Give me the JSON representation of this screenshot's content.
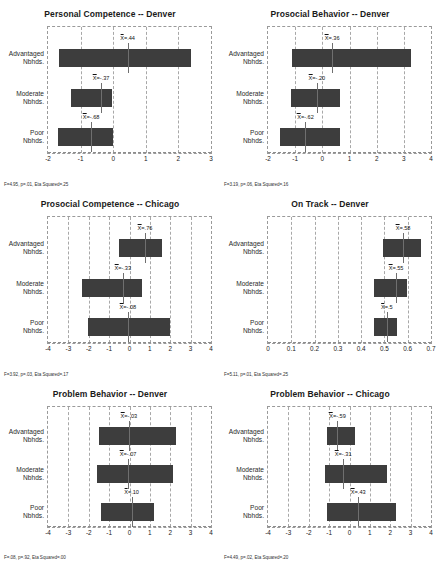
{
  "figure": {
    "background": "#ffffff",
    "bar_color": "#3d3d3d",
    "grid_color": "#9a9a9a"
  },
  "row_labels": [
    {
      "line1": "Advantaged",
      "line2": "Nbhds."
    },
    {
      "line1": "Moderate",
      "line2": "Nbhds."
    },
    {
      "line1": "Poor",
      "line2": "Nbhds."
    }
  ],
  "chart_data": [
    {
      "type": "bar",
      "title": "Personal Competence -- Denver",
      "xlabel": "",
      "ylabel": "",
      "xlim": [
        -2,
        3
      ],
      "ticks": [
        "-2",
        "-1",
        "0",
        "1",
        "2",
        "3"
      ],
      "tick_values": [
        -2,
        -1,
        0,
        1,
        2,
        3
      ],
      "grid": true,
      "categories": [
        "Advantaged Nbhds.",
        "Moderate Nbhds.",
        "Poor Nbhds."
      ],
      "bars": [
        {
          "start": -1.66,
          "end": 2.38,
          "mean": 0.44,
          "mean_label": "X=.44"
        },
        {
          "start": -1.28,
          "end": -0.03,
          "mean": -0.37,
          "mean_label": "X=-.37"
        },
        {
          "start": -1.7,
          "end": -0.02,
          "mean": -0.68,
          "mean_label": "X=-.68"
        }
      ],
      "footnote": "F=4.95, p=.01, Eta Squared=.25"
    },
    {
      "type": "bar",
      "title": "Prosocial Behavior -- Denver",
      "xlabel": "",
      "ylabel": "",
      "xlim": [
        -2,
        4
      ],
      "ticks": [
        "-2",
        "-1",
        "0",
        "1",
        "2",
        "3",
        "4"
      ],
      "tick_values": [
        -2,
        -1,
        0,
        1,
        2,
        3,
        4
      ],
      "grid": true,
      "categories": [
        "Advantaged Nbhds.",
        "Moderate Nbhds.",
        "Poor Nbhds."
      ],
      "bars": [
        {
          "start": -1.12,
          "end": 3.28,
          "mean": 0.36,
          "mean_label": "X=.36"
        },
        {
          "start": -1.16,
          "end": 0.66,
          "mean": -0.2,
          "mean_label": "X=-.20"
        },
        {
          "start": -1.56,
          "end": 0.66,
          "mean": -0.62,
          "mean_label": "X=-.62"
        }
      ],
      "footnote": "F=3.19, p=.06, Eta Squared=.16"
    },
    {
      "type": "bar",
      "title": "Prosocial Competence -- Chicago",
      "xlabel": "",
      "ylabel": "",
      "xlim": [
        -4,
        4
      ],
      "ticks": [
        "-4",
        "-3",
        "-2",
        "-1",
        "0",
        "1",
        "2",
        "3",
        "4"
      ],
      "tick_values": [
        -4,
        -3,
        -2,
        -1,
        0,
        1,
        2,
        3,
        4
      ],
      "grid": true,
      "categories": [
        "Advantaged Nbhds.",
        "Moderate Nbhds.",
        "Poor Nbhds."
      ],
      "bars": [
        {
          "start": -0.52,
          "end": 1.62,
          "mean": 0.76,
          "mean_label": "X=.76"
        },
        {
          "start": -2.32,
          "end": 0.62,
          "mean": -0.33,
          "mean_label": "X=-.33"
        },
        {
          "start": -2.02,
          "end": 1.98,
          "mean": -0.08,
          "mean_label": "X=-.08"
        }
      ],
      "footnote": "F=3.92, p=.03, Eta Squared=.17"
    },
    {
      "type": "bar",
      "title": "On Track -- Denver",
      "xlabel": "",
      "ylabel": "",
      "xlim": [
        0,
        0.7
      ],
      "ticks": [
        "0",
        "0.1",
        "0.2",
        "0.3",
        "0.4",
        "0.5",
        "0.6",
        "0.7"
      ],
      "tick_values": [
        0,
        0.1,
        0.2,
        0.3,
        0.4,
        0.5,
        0.6,
        0.7
      ],
      "grid": true,
      "categories": [
        "Advantaged Nbhds.",
        "Moderate Nbhds.",
        "Poor Nbhds."
      ],
      "bars": [
        {
          "start": 0.492,
          "end": 0.655,
          "mean": 0.58,
          "mean_label": "X=.58"
        },
        {
          "start": 0.455,
          "end": 0.595,
          "mean": 0.55,
          "mean_label": "X=.55"
        },
        {
          "start": 0.455,
          "end": 0.552,
          "mean": 0.51,
          "mean_label": "X=.5"
        }
      ],
      "footnote": "F=5.11, p=.01, Eta Squared=.25"
    },
    {
      "type": "bar",
      "title": "Problem Behavior  --  Denver",
      "xlabel": "",
      "ylabel": "",
      "xlim": [
        -4,
        4
      ],
      "ticks": [
        "-4",
        "-3",
        "-2",
        "-1",
        "0",
        "1",
        "2",
        "3",
        "4"
      ],
      "tick_values": [
        -4,
        -3,
        -2,
        -1,
        0,
        1,
        2,
        3,
        4
      ],
      "grid": true,
      "categories": [
        "Advantaged Nbhds.",
        "Moderate Nbhds.",
        "Poor Nbhds."
      ],
      "bars": [
        {
          "start": -1.5,
          "end": 2.28,
          "mean": -0.03,
          "mean_label": "X=-.03"
        },
        {
          "start": -1.58,
          "end": 2.16,
          "mean": -0.07,
          "mean_label": "X=-.07"
        },
        {
          "start": -1.42,
          "end": 1.22,
          "mean": 0.1,
          "mean_label": "X=.10"
        }
      ],
      "footnote": "F=.08, p=.92, Eta Squared=.00"
    },
    {
      "type": "bar",
      "title": "Problem Behavior  --  Chicago",
      "xlabel": "",
      "ylabel": "",
      "xlim": [
        -4,
        4
      ],
      "ticks": [
        "-4",
        "-3",
        "-2",
        "-1",
        "0",
        "1",
        "2",
        "3",
        "4"
      ],
      "tick_values": [
        -4,
        -3,
        -2,
        -1,
        0,
        1,
        2,
        3,
        4
      ],
      "grid": true,
      "categories": [
        "Advantaged Nbhds.",
        "Moderate Nbhds.",
        "Poor Nbhds."
      ],
      "bars": [
        {
          "start": -1.1,
          "end": 0.28,
          "mean": -0.59,
          "mean_label": "X=-.59"
        },
        {
          "start": -1.18,
          "end": 1.82,
          "mean": -0.31,
          "mean_label": "X=-.31"
        },
        {
          "start": -1.1,
          "end": 2.28,
          "mean": 0.43,
          "mean_label": "X=.43"
        }
      ],
      "footnote": "F=4.49, p=.02, Eta Squared=.20"
    }
  ]
}
